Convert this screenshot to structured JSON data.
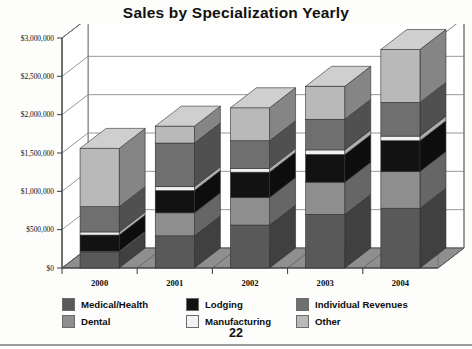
{
  "document": {
    "page_number": "22"
  },
  "chart": {
    "title": "Sales by Specialization Yearly"
  },
  "legend": {
    "position": "bottom",
    "columns": [
      [
        {
          "label": "Medical/Health",
          "color": "#595959"
        },
        {
          "label": "Dental",
          "color": "#8e8e8e"
        }
      ],
      [
        {
          "label": "Lodging",
          "color": "#121212"
        },
        {
          "label": "Manufacturing",
          "color": "#f2f2f2"
        }
      ],
      [
        {
          "label": "Individual Revenues",
          "color": "#6f6f6f"
        },
        {
          "label": "Other",
          "color": "#b9b9b9"
        }
      ]
    ]
  },
  "chart_data": {
    "type": "bar",
    "subtype": "stacked-3d-column",
    "title": "Sales by Specialization Yearly",
    "xlabel": "",
    "ylabel": "",
    "categories": [
      "2000",
      "2001",
      "2002",
      "2003",
      "2004"
    ],
    "ylim": [
      0,
      3000000
    ],
    "ytick_values": [
      0,
      500000,
      1000000,
      1500000,
      2000000,
      2500000,
      3000000
    ],
    "ytick_labels": [
      "$0",
      "$500,000",
      "$1,000,000",
      "$1,500,000",
      "$2,000,000",
      "$2,500,000",
      "$3,000,000"
    ],
    "grid": true,
    "legend": true,
    "series": [
      {
        "name": "Medical/Health",
        "color": "#595959",
        "values": [
          200000,
          420000,
          560000,
          700000,
          780000
        ]
      },
      {
        "name": "Dental",
        "color": "#8e8e8e",
        "values": [
          20000,
          300000,
          360000,
          420000,
          480000
        ]
      },
      {
        "name": "Lodging",
        "color": "#121212",
        "values": [
          210000,
          290000,
          330000,
          360000,
          400000
        ]
      },
      {
        "name": "Manufacturing",
        "color": "#f2f2f2",
        "values": [
          40000,
          50000,
          50000,
          60000,
          60000
        ]
      },
      {
        "name": "Individual Revenues",
        "color": "#6f6f6f",
        "values": [
          330000,
          570000,
          360000,
          400000,
          440000
        ]
      },
      {
        "name": "Other",
        "color": "#b9b9b9",
        "values": [
          760000,
          220000,
          430000,
          430000,
          690000
        ]
      }
    ],
    "totals": [
      1560000,
      1850000,
      2090000,
      2370000,
      2850000
    ]
  },
  "style": {
    "plot_floor": "#8f8f8f",
    "plot_back_wall": "#ffffff",
    "grid_color": "#7d7d7d",
    "axis_color": "#3a3a3a",
    "bar_side_shade": 0.72,
    "bar_top_shade": 1.12
  }
}
